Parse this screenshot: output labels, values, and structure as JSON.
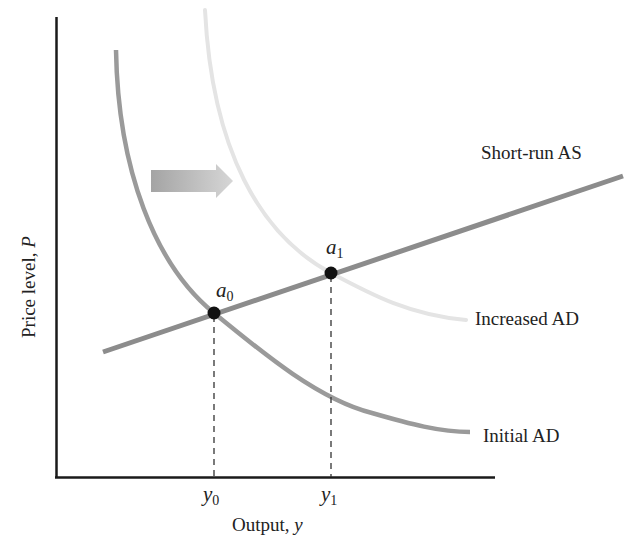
{
  "figure": {
    "title": "",
    "axes": {
      "x_label": "Output, ",
      "x_var": "y",
      "y_label": "Price level, ",
      "y_var": "P"
    },
    "curves": [
      {
        "id": "short-run-as",
        "label": "Short-run AS",
        "color": "#8c8c8c"
      },
      {
        "id": "initial-ad",
        "label": "Initial AD",
        "color": "#9a9a9a"
      },
      {
        "id": "increased-ad",
        "label": "Increased AD",
        "color": "#e6e6e6"
      }
    ],
    "points": [
      {
        "id": "a0",
        "base": "a",
        "sub": "0"
      },
      {
        "id": "a1",
        "base": "a",
        "sub": "1"
      }
    ],
    "ticks": [
      {
        "id": "y0",
        "base": "y",
        "sub": "0"
      },
      {
        "id": "y1",
        "base": "y",
        "sub": "1"
      }
    ],
    "shift_arrow": {
      "direction": "right",
      "meaning": "AD shifts right"
    },
    "colors": {
      "axis": "#1a1a1a",
      "point": "#111111",
      "arrow_start": "#a8a8a8",
      "arrow_end": "#d8d8d8"
    }
  }
}
